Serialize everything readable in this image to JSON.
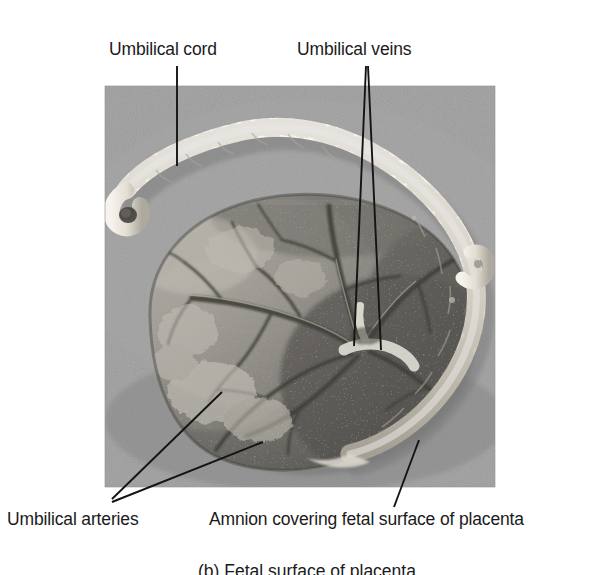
{
  "figure": {
    "kind": "anatomical-photograph",
    "caption": "(b) Fetal surface of placenta",
    "photo": {
      "x": 105,
      "y": 86,
      "width": 390,
      "height": 401,
      "background_color": "#9a9a9a",
      "border_color": "#8f8f8f"
    },
    "colors": {
      "text": "#1a1a1a",
      "leader_line": "#141414",
      "page_background": "#ffffff",
      "photo_background": "#9a9a9a",
      "cord_highlight": "#f2efe8",
      "cord_shadow": "#b9b4a8",
      "placenta_light": "#b3b0a8",
      "placenta_mid": "#8d8a84",
      "placenta_dark": "#5d5b57",
      "placenta_darkest": "#3c3b38",
      "vessel": "#2b2a28",
      "specular": "#efeee9"
    },
    "labels": [
      {
        "id": "umbilical-cord",
        "text": "Umbilical cord",
        "x": 109,
        "y": 41,
        "leaders": [
          {
            "x1": 177,
            "y1": 66,
            "x2": 177,
            "y2": 166
          }
        ]
      },
      {
        "id": "umbilical-veins",
        "text": "Umbilical veins",
        "x": 297,
        "y": 41,
        "leaders": [
          {
            "x1": 366,
            "y1": 66,
            "x2": 354,
            "y2": 346
          },
          {
            "x1": 368,
            "y1": 66,
            "x2": 381,
            "y2": 350
          }
        ]
      },
      {
        "id": "umbilical-arteries",
        "text": "Umbilical arteries",
        "x": 7,
        "y": 511,
        "leaders": [
          {
            "x1": 112,
            "y1": 499,
            "x2": 222,
            "y2": 392
          },
          {
            "x1": 112,
            "y1": 502,
            "x2": 263,
            "y2": 442
          }
        ]
      },
      {
        "id": "amnion",
        "text": "Amnion covering fetal surface of placenta",
        "x": 209,
        "y": 511,
        "leaders": [
          {
            "x1": 394,
            "y1": 507,
            "x2": 419,
            "y2": 440
          }
        ]
      }
    ]
  }
}
